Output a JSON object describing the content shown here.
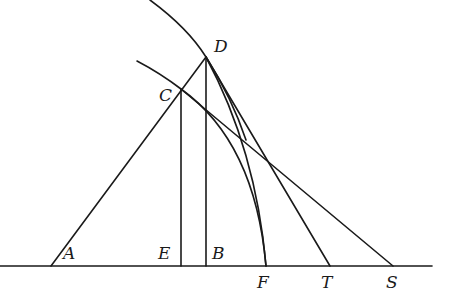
{
  "diagram": {
    "type": "geometric-construction",
    "stroke_color": "#1a1a1a",
    "background": "#ffffff",
    "points": {
      "A": {
        "label": "A",
        "x": 51,
        "y": 266
      },
      "E": {
        "label": "E",
        "x": 180,
        "y": 266
      },
      "B": {
        "label": "B",
        "x": 205,
        "y": 266
      },
      "F": {
        "label": "F",
        "x": 266,
        "y": 266
      },
      "T": {
        "label": "T",
        "x": 330,
        "y": 266
      },
      "S": {
        "label": "S",
        "x": 393,
        "y": 266
      },
      "C": {
        "label": "C",
        "x": 181,
        "y": 89
      },
      "D": {
        "label": "D",
        "x": 206,
        "y": 57
      }
    },
    "labels": {
      "A": "A",
      "B": "B",
      "C": "C",
      "D": "D",
      "E": "E",
      "F": "F",
      "S": "S",
      "T": "T"
    },
    "segments": [
      {
        "name": "baseline",
        "from": [
          0,
          266
        ],
        "to": [
          432,
          266
        ]
      },
      {
        "name": "line-A-D",
        "from": "A",
        "to": "D"
      },
      {
        "name": "line-C-E",
        "from": "C",
        "to": "E"
      },
      {
        "name": "line-D-B",
        "from": "D",
        "to": "B"
      },
      {
        "name": "line-D-T",
        "from": "D",
        "to": "T"
      },
      {
        "name": "line-C-S",
        "from": "C",
        "to": "S"
      }
    ],
    "arcs": [
      {
        "name": "outer-arc",
        "through": [
          "top",
          "D"
        ],
        "center": "A"
      },
      {
        "name": "inner-arc",
        "through": [
          "C",
          "F"
        ]
      },
      {
        "name": "arc-D-F",
        "through": [
          "D",
          "F"
        ]
      }
    ]
  }
}
